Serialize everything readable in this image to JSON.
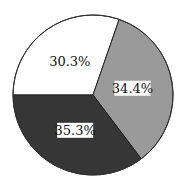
{
  "chart_data": {
    "type": "pie",
    "title": "",
    "start_angle_deg": 270,
    "direction": "clockwise",
    "slices": [
      {
        "label": "30.3%",
        "value": 30.3,
        "color": "#ffffff",
        "label_box": false
      },
      {
        "label": "34.4%",
        "value": 34.4,
        "color": "#9a9a9a",
        "label_box": true
      },
      {
        "label": "35.3%",
        "value": 35.3,
        "color": "#363636",
        "label_box": true
      }
    ],
    "legend": null
  }
}
